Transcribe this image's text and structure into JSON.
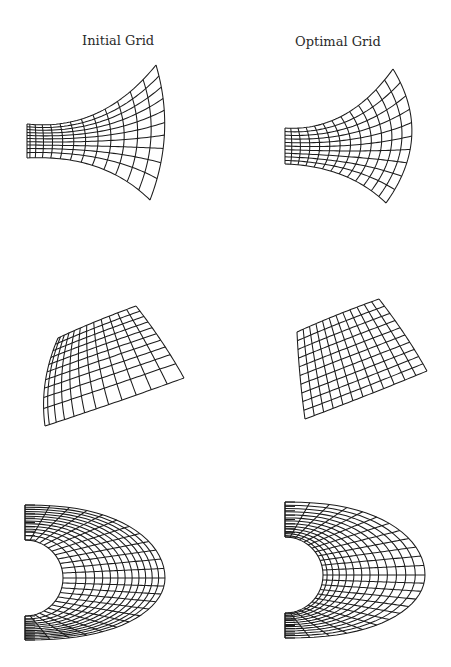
{
  "figure": {
    "columns": [
      {
        "title": "Initial Grid"
      },
      {
        "title": "Optimal Grid"
      }
    ],
    "line_color": "#1c1c1c",
    "background": "#ffffff",
    "panels": [
      {
        "id": "row1-initial",
        "shape": "flared-nozzle",
        "grid_lines_xi": 14,
        "grid_lines_eta": 11,
        "clustering": "strong-left-and-bottom",
        "left_edge": {
          "x": 27,
          "y_top": 124,
          "y_bottom": 158
        },
        "top_corner": [
          156,
          65
        ],
        "bottom_corner": [
          150,
          200
        ],
        "right_arc_bulge_x": 168
      },
      {
        "id": "row1-optimal",
        "shape": "flared-nozzle",
        "grid_lines_xi": 14,
        "grid_lines_eta": 11,
        "clustering": "smooth",
        "left_edge": {
          "x": 285,
          "y_top": 128,
          "y_bottom": 164
        },
        "top_corner": [
          393,
          69
        ],
        "bottom_corner": [
          386,
          203
        ],
        "right_arc_bulge_x": 426
      },
      {
        "id": "row2-initial",
        "shape": "curved-quadrilateral",
        "grid_lines_xi": 13,
        "grid_lines_eta": 11,
        "clustering": "strong-top-left",
        "corners": {
          "tl": [
            58,
            338
          ],
          "tr": [
            136,
            306
          ],
          "br": [
            184,
            378
          ],
          "bl": [
            45,
            426
          ]
        }
      },
      {
        "id": "row2-optimal",
        "shape": "curved-quadrilateral",
        "grid_lines_xi": 13,
        "grid_lines_eta": 11,
        "clustering": "smooth",
        "corners": {
          "tl": [
            297,
            332
          ],
          "tr": [
            379,
            299
          ],
          "br": [
            427,
            371
          ],
          "bl": [
            305,
            419
          ]
        }
      },
      {
        "id": "row3-initial",
        "shape": "c-annulus",
        "grid_lines_radial": 14,
        "grid_lines_around": 25,
        "clustering": "compressed-outer-right",
        "offset_x": 25,
        "center_y": 578,
        "inner_radius": 38,
        "outer_top_y": 505,
        "outer_bottom_y": 640,
        "outer_right_x": 165
      },
      {
        "id": "row3-optimal",
        "shape": "c-annulus",
        "grid_lines_radial": 14,
        "grid_lines_around": 25,
        "clustering": "smooth",
        "offset_x": 285,
        "center_y": 575,
        "inner_radius": 38,
        "outer_top_y": 502,
        "outer_bottom_y": 638,
        "outer_right_x": 425
      }
    ]
  }
}
